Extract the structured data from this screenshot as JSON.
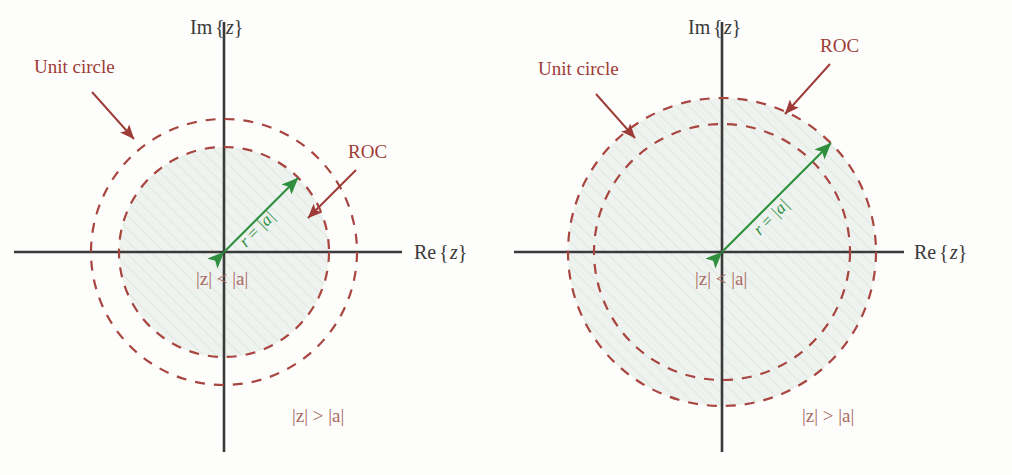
{
  "figure": {
    "background_color": "#fdfdfc",
    "colors": {
      "axis": "#3a3a3a",
      "circle_dash": "#a8453f",
      "annotation_red": "#9e3b36",
      "region_text": "#a96a63",
      "arrow_green": "#2f8f3f",
      "shade_fill": "#eef2ef",
      "hatch": "#d9e2dc"
    },
    "panels": [
      {
        "id": "left",
        "case": "causal",
        "origin": {
          "x": 224,
          "y": 252
        },
        "axis_labels": {
          "imaginary": "Im {z}",
          "imaginary_prefix": "Im",
          "imaginary_var": "z",
          "real": "Re {z}",
          "real_prefix": "Re",
          "real_var": "z"
        },
        "circles": [
          {
            "name": "unit-circle",
            "radius": 133,
            "style": "dashed"
          },
          {
            "name": "roc-boundary",
            "radius": 105,
            "style": "dashed"
          }
        ],
        "shaded_radius": 105,
        "shaded_region": "inside-inner-circle",
        "annotations": [
          {
            "name": "unit-circle-label",
            "text": "Unit circle",
            "x": 34,
            "y": 58,
            "arrow_from": {
              "x": 92,
              "y": 92
            },
            "arrow_to": {
              "x": 136,
              "y": 141
            }
          },
          {
            "name": "roc-label",
            "text": "ROC",
            "x": 349,
            "y": 143,
            "arrow_from": {
              "x": 354,
              "y": 172
            },
            "arrow_to": {
              "x": 306,
              "y": 219
            }
          }
        ],
        "radius_arrow": {
          "name": "radius-arrow",
          "label": "r = |a|",
          "label_parts": {
            "var": "r",
            "eq": "=",
            "mag": "|a|"
          },
          "from": {
            "x": 224,
            "y": 252
          },
          "to": {
            "x": 298,
            "y": 178
          },
          "label_angle_deg": -45
        },
        "region_labels": [
          {
            "name": "inside-region-label",
            "text": "|z| < |a|",
            "x": 197,
            "y": 270
          },
          {
            "name": "outside-region-label",
            "text": "|z| > |a|",
            "x": 293,
            "y": 407
          }
        ]
      },
      {
        "id": "right",
        "case": "anticausal",
        "origin": {
          "x": 216,
          "y": 252
        },
        "axis_labels": {
          "imaginary": "Im {z}",
          "imaginary_prefix": "Im",
          "imaginary_var": "z",
          "real": "Re {z}",
          "real_prefix": "Re",
          "real_var": "z"
        },
        "circles": [
          {
            "name": "roc-boundary",
            "radius": 154,
            "style": "dashed"
          },
          {
            "name": "unit-circle",
            "radius": 128,
            "style": "dashed"
          }
        ],
        "shaded_radius": 154,
        "shaded_region": "inside-outer-circle",
        "annotations": [
          {
            "name": "unit-circle-label",
            "text": "Unit circle",
            "x": 32,
            "y": 60,
            "arrow_from": {
              "x": 90,
              "y": 94
            },
            "arrow_to": {
              "x": 131,
              "y": 140
            }
          },
          {
            "name": "roc-label",
            "text": "ROC",
            "x": 315,
            "y": 37,
            "arrow_from": {
              "x": 322,
              "y": 66
            },
            "arrow_to": {
              "x": 277,
              "y": 116
            }
          },
          {
            "name": "roc-leader",
            "text": "",
            "x": 0,
            "y": 0
          }
        ],
        "radius_arrow": {
          "name": "radius-arrow",
          "label": "r = |a|",
          "label_parts": {
            "var": "r",
            "eq": "=",
            "mag": "|a|"
          },
          "from": {
            "x": 216,
            "y": 252
          },
          "to": {
            "x": 324,
            "y": 144
          },
          "label_angle_deg": -45
        },
        "region_labels": [
          {
            "name": "inside-region-label",
            "text": "|z| < |a|",
            "x": 190,
            "y": 270
          },
          {
            "name": "outside-region-label",
            "text": "|z| > |a|",
            "x": 297,
            "y": 407
          }
        ]
      }
    ]
  }
}
